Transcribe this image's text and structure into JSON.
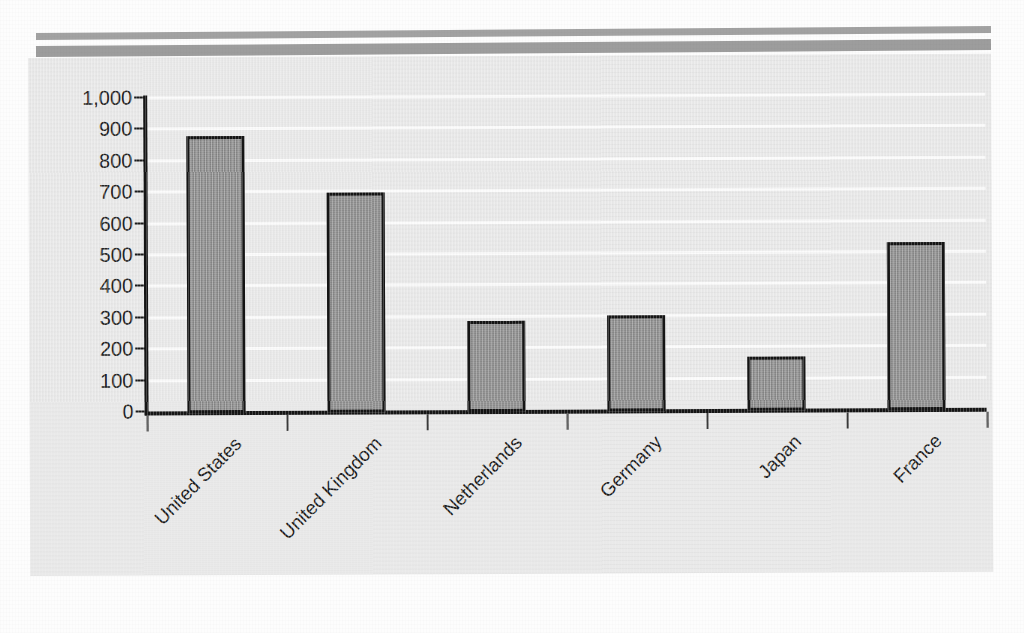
{
  "page": {
    "background_color": "#fdfdfd",
    "panel_color": "#e9e9e9",
    "rule_color": "#9d9d9d",
    "header_rules": [
      "header-rule-top",
      "header-rule-bottom"
    ]
  },
  "chart_data": {
    "type": "bar",
    "title": "",
    "subtitle": "",
    "xlabel": "",
    "ylabel": "",
    "categories": [
      "United States",
      "United Kingdom",
      "Netherlands",
      "Germany",
      "Japan",
      "France"
    ],
    "values": [
      875,
      695,
      285,
      300,
      165,
      530
    ],
    "ylim": [
      0,
      1000
    ],
    "ytick_values": [
      0,
      100,
      200,
      300,
      400,
      500,
      600,
      700,
      800,
      900,
      1000
    ],
    "ytick_labels": [
      "0",
      "100",
      "200",
      "300",
      "400",
      "500",
      "600",
      "700",
      "800",
      "900",
      "1,000"
    ],
    "grid": true,
    "gridline_color": "#fbfbfb",
    "legend": null,
    "legend_position": "none",
    "bar_fill_color": "#919191",
    "bar_edge_color": "#141414",
    "axis_color": "#151515",
    "tick_label_rotation": -45,
    "annotations": []
  }
}
